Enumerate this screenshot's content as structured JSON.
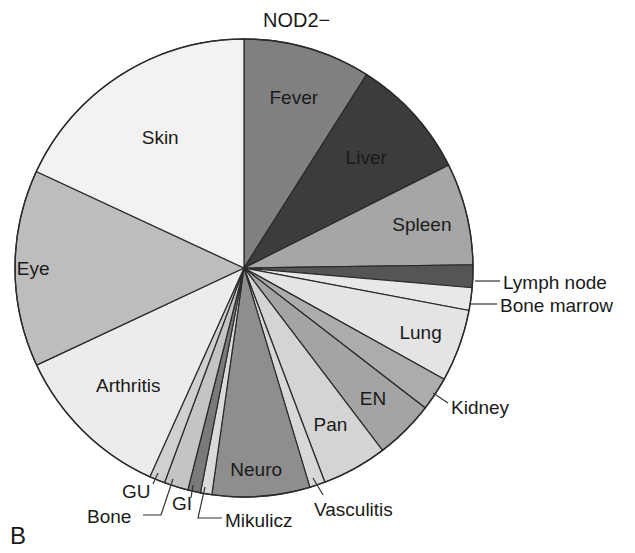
{
  "chart_data": {
    "type": "pie",
    "title": "NOD2−",
    "panel_label": "B",
    "start_angle": "12 o'clock",
    "direction": "clockwise",
    "unit": "percent (estimated from slice angles)",
    "slices": [
      {
        "label": "Fever",
        "value": 9.0,
        "color": "#808080",
        "text_color": "#f2f2f2",
        "label_style": "inside"
      },
      {
        "label": "Liver",
        "value": 8.6,
        "color": "#3c3c3c",
        "text_color": "#f2f2f2",
        "label_style": "inside"
      },
      {
        "label": "Spleen",
        "value": 7.2,
        "color": "#a6a6a6",
        "text_color": "#1a1a1a",
        "label_style": "inside"
      },
      {
        "label": "Lymph node",
        "value": 1.6,
        "color": "#555555",
        "text_color": "#1a1a1a",
        "label_style": "outside"
      },
      {
        "label": "Bone marrow",
        "value": 1.6,
        "color": "#e8e8e8",
        "text_color": "#1a1a1a",
        "label_style": "outside"
      },
      {
        "label": "Lung",
        "value": 5.1,
        "color": "#e4e4e4",
        "text_color": "#1a1a1a",
        "label_style": "inside"
      },
      {
        "label": "Kidney",
        "value": 2.4,
        "color": "#acacac",
        "text_color": "#1a1a1a",
        "label_style": "outside"
      },
      {
        "label": "EN",
        "value": 4.2,
        "color": "#a4a4a4",
        "text_color": "#1a1a1a",
        "label_style": "inside"
      },
      {
        "label": "Pan",
        "value": 4.6,
        "color": "#d4d4d4",
        "text_color": "#1a1a1a",
        "label_style": "inside"
      },
      {
        "label": "Vasculitis",
        "value": 1.1,
        "color": "#d8d8d8",
        "text_color": "#1a1a1a",
        "label_style": "outside"
      },
      {
        "label": "Neuro",
        "value": 6.9,
        "color": "#8e8e8e",
        "text_color": "#1a1a1a",
        "label_style": "inside"
      },
      {
        "label": "Mikulicz",
        "value": 0.8,
        "color": "#dadada",
        "text_color": "#1a1a1a",
        "label_style": "outside"
      },
      {
        "label": "GI",
        "value": 0.9,
        "color": "#7a7a7a",
        "text_color": "#1a1a1a",
        "label_style": "outside"
      },
      {
        "label": "Bone",
        "value": 1.7,
        "color": "#c4c4c4",
        "text_color": "#1a1a1a",
        "label_style": "outside"
      },
      {
        "label": "GU",
        "value": 1.1,
        "color": "#d0d0d0",
        "text_color": "#1a1a1a",
        "label_style": "outside"
      },
      {
        "label": "Arthritis",
        "value": 11.3,
        "color": "#ececec",
        "text_color": "#1a1a1a",
        "label_style": "inside"
      },
      {
        "label": "Eye",
        "value": 13.9,
        "color": "#bdbdbd",
        "text_color": "#1a1a1a",
        "label_style": "inside"
      },
      {
        "label": "Skin",
        "value": 18.1,
        "color": "#f2f2f2",
        "text_color": "#1a1a1a",
        "label_style": "inside"
      }
    ],
    "legend": "none (labels on/near slices)"
  }
}
